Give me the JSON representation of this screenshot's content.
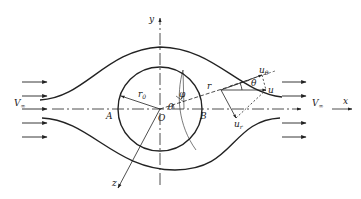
{
  "diagram": {
    "colors": {
      "stroke": "#222222",
      "background": "#ffffff"
    },
    "axes": {
      "x_label": "x",
      "y_label": "y",
      "z_label": "z",
      "origin_label": "O"
    },
    "points": {
      "A": "A",
      "B": "B"
    },
    "labels": {
      "freestream_left": "V",
      "freestream_left_sub": "∞",
      "freestream_right": "V",
      "freestream_right_sub": "∞",
      "radius": "r",
      "radius_sub": "0",
      "radial_coord": "r",
      "theta_center": "θ",
      "phi": "φ",
      "velocity": "u",
      "velocity_theta": "u",
      "velocity_theta_sub": "θ",
      "velocity_r": "u",
      "velocity_r_sub": "r",
      "theta_vec": "θ"
    }
  }
}
